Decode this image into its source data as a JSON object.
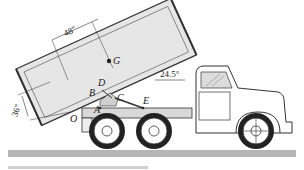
{
  "diagram": {
    "type": "engineering-mechanics-figure",
    "labels": {
      "G": "G",
      "D": "D",
      "B": "B",
      "C": "C",
      "A": "A",
      "E": "E",
      "O": "O"
    },
    "dimensions": {
      "horizontal": "48″",
      "vertical": "36″",
      "angle": "24.5°"
    },
    "colors": {
      "line": "#333333",
      "body_fill": "#e6e6e6",
      "ground": "#b5b5b5",
      "background": "#ffffff"
    }
  }
}
